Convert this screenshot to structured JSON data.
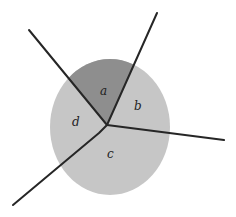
{
  "diagram": {
    "type": "partitioned-circle",
    "colors": {
      "background": "#ffffff",
      "circle_fill": "#c6c6c6",
      "highlight_fill": "#8e8e8e",
      "line": "#262626"
    },
    "circle": {
      "cx": 110,
      "cy": 127,
      "rx": 60,
      "ry": 68
    },
    "center_point": {
      "x": 107,
      "y": 125
    },
    "rays": [
      {
        "name": "upper-left",
        "points": "107,125 29,30"
      },
      {
        "name": "upper-right",
        "points": "107,125 157,13"
      },
      {
        "name": "right",
        "points": "107,125 224,140"
      },
      {
        "name": "lower-left",
        "points": "107,125 99,133 13,205"
      }
    ],
    "regions": [
      {
        "id": "a",
        "label": "a",
        "x": 100,
        "y": 95,
        "highlighted": true
      },
      {
        "id": "b",
        "label": "b",
        "x": 134,
        "y": 110,
        "highlighted": false
      },
      {
        "id": "c",
        "label": "c",
        "x": 107,
        "y": 158,
        "highlighted": false
      },
      {
        "id": "d",
        "label": "d",
        "x": 72,
        "y": 126,
        "highlighted": false
      }
    ]
  }
}
